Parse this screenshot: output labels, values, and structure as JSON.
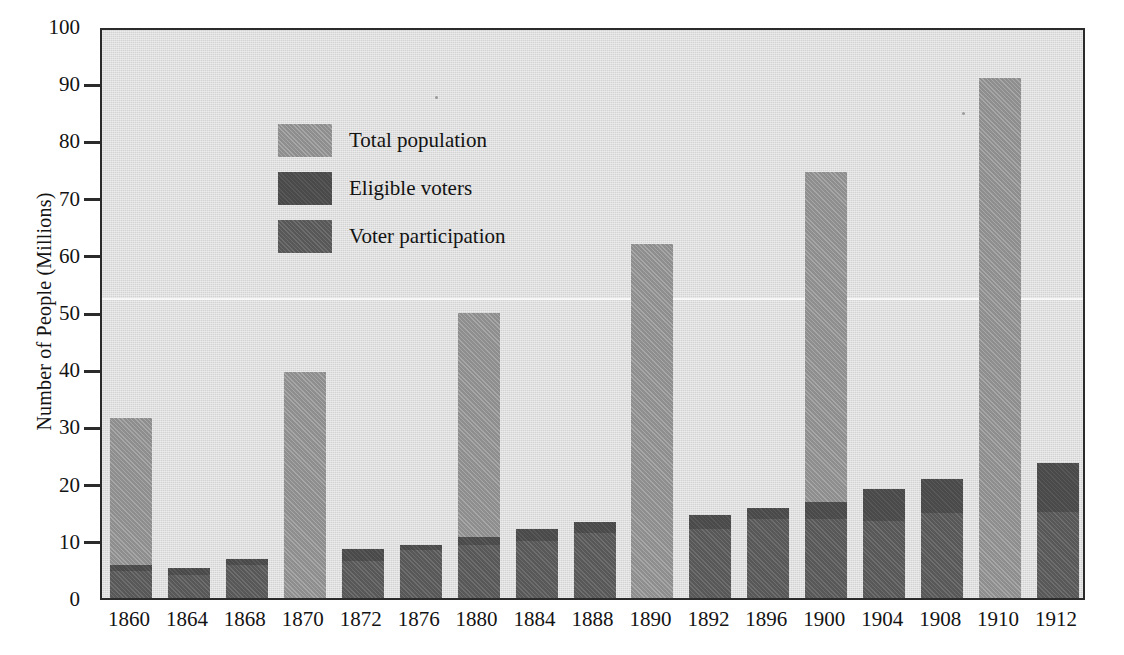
{
  "chart_data": {
    "type": "bar",
    "title": "",
    "subtitle": "",
    "xlabel": "",
    "ylabel": "Number of People (Millions)",
    "ylim": [
      0,
      100
    ],
    "y_ticks": [
      0,
      10,
      20,
      30,
      40,
      50,
      60,
      70,
      80,
      90,
      100
    ],
    "grid": false,
    "legend_position": "upper-left-inside",
    "stacked": false,
    "overlaid": true,
    "categories": [
      "1860",
      "1864",
      "1868",
      "1870",
      "1872",
      "1876",
      "1880",
      "1884",
      "1888",
      "1890",
      "1892",
      "1896",
      "1900",
      "1904",
      "1908",
      "1910",
      "1912"
    ],
    "series": [
      {
        "name": "Total population",
        "color": "#8e8e8e",
        "values": [
          31.4,
          null,
          null,
          39.5,
          null,
          null,
          49.8,
          null,
          null,
          61.9,
          null,
          null,
          74.4,
          null,
          null,
          90.9,
          null
        ]
      },
      {
        "name": "Eligible voters",
        "color": "#4a4a4a",
        "values": [
          5.8,
          5.2,
          6.8,
          null,
          8.6,
          9.3,
          10.6,
          12.0,
          13.3,
          null,
          14.6,
          15.8,
          16.8,
          19.0,
          20.8,
          null,
          23.6
        ]
      },
      {
        "name": "Voter participation",
        "color": "#585858",
        "values": [
          4.7,
          4.0,
          5.7,
          null,
          6.5,
          8.4,
          9.2,
          10.0,
          11.4,
          null,
          12.0,
          13.8,
          13.9,
          13.5,
          14.9,
          null,
          15.0
        ]
      }
    ]
  },
  "axes": {
    "y_title": "Number of People (Millions)",
    "y_tick_labels": [
      "0",
      "10",
      "20",
      "30",
      "40",
      "50",
      "60",
      "70",
      "80",
      "90",
      "100"
    ],
    "x_tick_labels": [
      "1860",
      "1864",
      "1868",
      "1870",
      "1872",
      "1876",
      "1880",
      "1884",
      "1888",
      "1890",
      "1892",
      "1896",
      "1900",
      "1904",
      "1908",
      "1910",
      "1912"
    ]
  },
  "legend": {
    "items": [
      {
        "label": "Total population",
        "color": "#8e8e8e"
      },
      {
        "label": "Eligible voters",
        "color": "#4a4a4a"
      },
      {
        "label": "Voter participation",
        "color": "#585858"
      }
    ]
  },
  "colors": {
    "plot_background": "#d3d3d3",
    "page_background": "#ffffff",
    "axis": "#2b2b2b",
    "text": "#131313",
    "total_population": "#8e8e8e",
    "eligible_voters": "#4a4a4a",
    "voter_participation": "#585858"
  }
}
